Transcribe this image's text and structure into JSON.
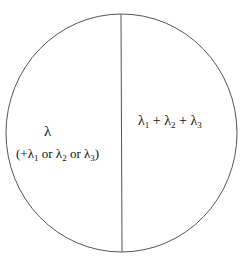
{
  "diagram": {
    "shape": "circle divided by vertical line",
    "left_region": {
      "symbol": "λ",
      "note_prefix": "(+",
      "note_parts": [
        {
          "base": "λ",
          "sub": "1"
        },
        {
          "text": " or "
        },
        {
          "base": "λ",
          "sub": "2"
        },
        {
          "text": " or "
        },
        {
          "base": "λ",
          "sub": "3"
        }
      ],
      "note_suffix": ")"
    },
    "right_region": {
      "parts": [
        {
          "base": "λ",
          "sub": "1"
        },
        {
          "text": " + "
        },
        {
          "base": "λ",
          "sub": "2"
        },
        {
          "text": " + "
        },
        {
          "base": "λ",
          "sub": "3"
        }
      ]
    },
    "colors": {
      "stroke": "#555555",
      "text": "#111111",
      "background": "#ffffff"
    }
  }
}
